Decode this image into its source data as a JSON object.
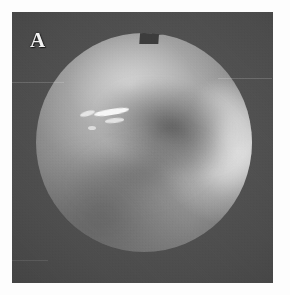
{
  "figure": {
    "panel_label": "A",
    "caption": "",
    "kind": "endoscopic-photograph",
    "modality": "white-light endoscopy",
    "colorspace": "grayscale"
  },
  "plate": {
    "background_color": "#3f3f3f",
    "surround_color": "#474747",
    "page_color": "#ffffff"
  },
  "field_of_view": {
    "shape": "circle",
    "has_top_notch": true,
    "center_tone": "#a3a3a3",
    "rim_highlight_color": "#ffffff",
    "shadow_color": "#3c3c3c"
  },
  "features": {
    "specular_highlights": [
      {
        "name": "highlight-primary",
        "tone": "#f7f7f7"
      },
      {
        "name": "highlight-secondary",
        "tone": "#e6e6e6"
      },
      {
        "name": "highlight-tertiary",
        "tone": "#e2e2e2"
      },
      {
        "name": "highlight-speck",
        "tone": "#dcdcdc"
      }
    ],
    "mucosal_fold": {
      "name": "diagonal-fold-shadow",
      "tone": "#3c3c3c"
    },
    "bright_rim": {
      "name": "right-edge-glow",
      "tone": "#ffffff"
    }
  },
  "artifacts": {
    "scan_lines": [
      "upper-left-streak",
      "upper-right-streak",
      "lower-left-streak"
    ],
    "grain": "film-grain"
  }
}
